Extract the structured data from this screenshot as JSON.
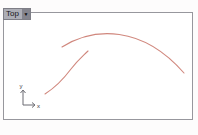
{
  "viewport": {
    "title": "Top",
    "dropdown_icon": "▼",
    "colors": {
      "tab_background": "#adaeb6",
      "tab_caret_background": "#84848d",
      "border": "#97979d",
      "canvas_background": "#ffffff"
    }
  },
  "axes": {
    "x_label": "x",
    "y_label": "y",
    "color": "#6b6b72"
  },
  "curves": {
    "color": "#cb7a6f",
    "arc_path": "M 58 34 C 90 14 138 12 180 60",
    "s_curve_path": "M 41 81 C 52 74 58 68 67 56 C 74 47 78 44 84 38"
  },
  "axis_gizmo": {
    "y_line": "M 19 92 L 19 78",
    "y_arrow": "M 16.5 80 L 19 77 L 21.5 80",
    "x_line": "M 19 92 L 30 92",
    "x_arrow": "M 28 89.5 L 31 92 L 28 94.5"
  }
}
